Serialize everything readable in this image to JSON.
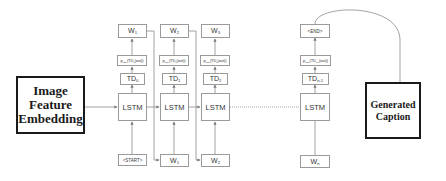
{
  "diagram": {
    "input_block": {
      "label_lines": [
        "Image",
        "Feature",
        "Embedding"
      ]
    },
    "output_block": {
      "label_lines": [
        "Generated",
        "Caption"
      ]
    },
    "columns": [
      {
        "output": "W",
        "output_sub": "1",
        "softmax": "softmax(TD0(out))",
        "softmax_main": "p",
        "softmax_sub": "max",
        "softmax_rest": "(TD",
        "softmax_idx": "0",
        "softmax_end": "(out))",
        "td": "TD",
        "td_sub": "0",
        "cell": "LSTM",
        "input": "<START>",
        "input_sub": ""
      },
      {
        "output": "W",
        "output_sub": "2",
        "softmax": "softmax(TD1(out))",
        "softmax_main": "p",
        "softmax_sub": "max",
        "softmax_rest": "(TD",
        "softmax_idx": "1",
        "softmax_end": "(out))",
        "td": "TD",
        "td_sub": "1",
        "cell": "LSTM",
        "input": "W",
        "input_sub": "1"
      },
      {
        "output": "W",
        "output_sub": "3",
        "softmax": "softmax(TD2(out))",
        "softmax_main": "p",
        "softmax_sub": "max",
        "softmax_rest": "(TD",
        "softmax_idx": "2",
        "softmax_end": "(out))",
        "td": "TD",
        "td_sub": "2",
        "cell": "LSTM",
        "input": "W",
        "input_sub": "2"
      },
      {
        "output": "<END>",
        "output_sub": "",
        "softmax": "softmax(TDn-1(out))",
        "softmax_main": "p",
        "softmax_sub": "max",
        "softmax_rest": "(TD",
        "softmax_idx": "n-1",
        "softmax_end": "(out))",
        "td": "TD",
        "td_sub": "n-1",
        "cell": "LSTM",
        "input": "W",
        "input_sub": "n"
      }
    ],
    "connector_style": {
      "line_color": "#8a8a8a",
      "dotted_between": [
        "column-3",
        "column-n"
      ]
    }
  }
}
